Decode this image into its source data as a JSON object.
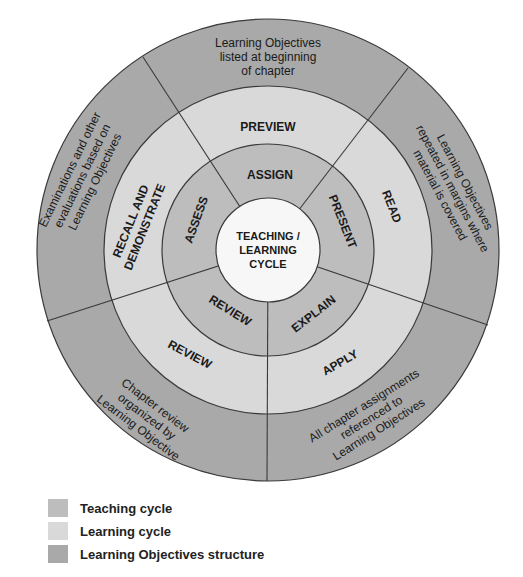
{
  "colors": {
    "teaching": "#bdbdbd",
    "learning": "#d9d9d9",
    "objectives": "#a9a9a9",
    "center": "#f7f7f7",
    "line": "#3a3a3a"
  },
  "center": {
    "line1": "TEACHING /",
    "line2": "LEARNING",
    "line3": "CYCLE"
  },
  "teaching_ring": {
    "assign": "ASSIGN",
    "present": "PRESENT",
    "explain": "EXPLAIN",
    "review": "REVIEW",
    "assess": "ASSESS"
  },
  "learning_ring": {
    "preview": "PREVIEW",
    "read": "READ",
    "apply": "APPLY",
    "review": "REVIEW",
    "recall_line1": "RECALL AND",
    "recall_line2": "DEMONSTRATE"
  },
  "objectives_ring": {
    "top": [
      "Learning Objectives",
      "listed at beginning",
      "of chapter"
    ],
    "right": [
      "Learning Objectives",
      "repeated in margins where",
      "material is covered"
    ],
    "bottom_right": [
      "All chapter assignments",
      "referenced to",
      "Learning Objectives"
    ],
    "bottom_left": [
      "Chapter review",
      "organized by",
      "Learning Objective"
    ],
    "left": [
      "Examinations and other",
      "evaluations based on",
      "Learning Objectives"
    ]
  },
  "legend": [
    {
      "label": "Teaching cycle",
      "color": "#bdbdbd"
    },
    {
      "label": "Learning cycle",
      "color": "#d9d9d9"
    },
    {
      "label": "Learning Objectives structure",
      "color": "#a9a9a9"
    }
  ]
}
